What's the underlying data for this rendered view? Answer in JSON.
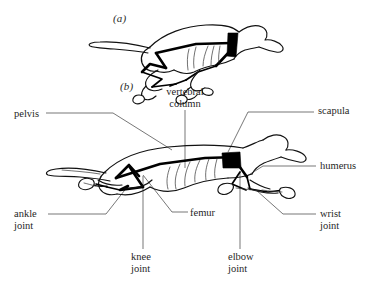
{
  "figure": {
    "background_color": "#ffffff",
    "ink_color": "#111111",
    "leader_color": "#3c3c3c",
    "scapula_color": "#000000"
  },
  "panels": [
    {
      "id": "a",
      "marker": "(a)",
      "caption": ""
    },
    {
      "id": "b",
      "marker": "(b)",
      "caption": ""
    }
  ],
  "labels": {
    "pelvis": "pelvis",
    "vertebral_column": "vertebral\ncolumn",
    "scapula": "scapula",
    "humerus": "humerus",
    "ankle_joint": "ankle\njoint",
    "femur": "femur",
    "knee_joint": "knee\njoint",
    "elbow_joint": "elbow\njoint",
    "wrist_joint": "wrist\njoint"
  }
}
